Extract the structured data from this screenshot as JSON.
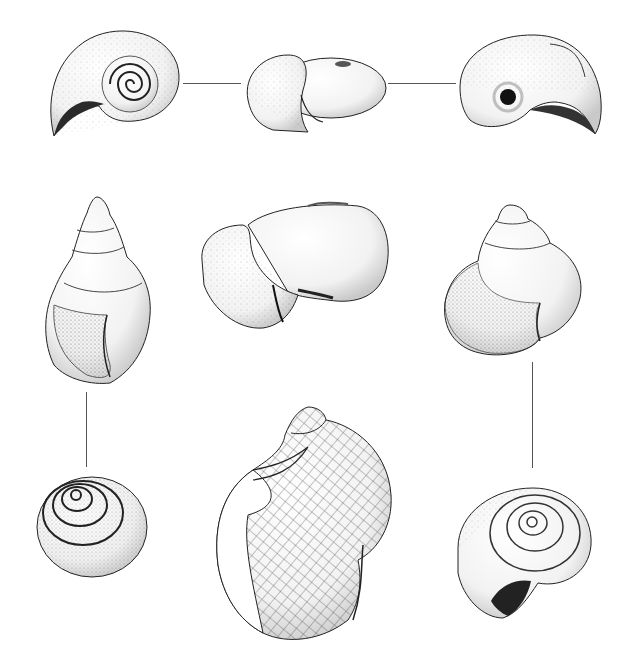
{
  "plate": {
    "background": "#ffffff",
    "ink": "#1a1a1a",
    "layout": "3x3 grid of shell illustrations with thin connector lines",
    "figures": [
      {
        "id": "planorbid-apical",
        "row": 1,
        "col": 1,
        "view": "apical (top) view, planispiral coil"
      },
      {
        "id": "planorbid-apertural",
        "row": 1,
        "col": 2,
        "view": "apertural/side view, flattened"
      },
      {
        "id": "planorbid-umbilical",
        "row": 1,
        "col": 3,
        "view": "umbilical (bottom) view"
      },
      {
        "id": "lymnaeid-apertural",
        "row": 2,
        "col": 1,
        "view": "apertural view, conical spire"
      },
      {
        "id": "physid-lateral",
        "row": 2,
        "col": 2,
        "view": "lateral view, ovate inflated"
      },
      {
        "id": "viviparid-apertural",
        "row": 2,
        "col": 3,
        "view": "apertural view, globose"
      },
      {
        "id": "lymnaeid-apical",
        "row": 3,
        "col": 1,
        "view": "apical view, whorls spiral"
      },
      {
        "id": "cancellate-apertural",
        "row": 3,
        "col": 2,
        "view": "apertural view, cancellate sculpture (net pattern)"
      },
      {
        "id": "viviparid-basal",
        "row": 3,
        "col": 3,
        "view": "basal/umbilical view with aperture"
      }
    ],
    "connectors": [
      {
        "from": "planorbid-apical",
        "to": "planorbid-apertural",
        "orientation": "horizontal"
      },
      {
        "from": "planorbid-apertural",
        "to": "planorbid-umbilical",
        "orientation": "horizontal"
      },
      {
        "from": "lymnaeid-apertural",
        "to": "lymnaeid-apical",
        "orientation": "vertical"
      },
      {
        "from": "viviparid-apertural",
        "to": "viviparid-basal",
        "orientation": "vertical"
      }
    ]
  }
}
